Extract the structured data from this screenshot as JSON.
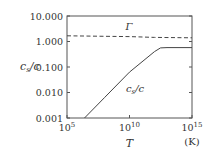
{
  "chart_data": {
    "type": "line",
    "title": "",
    "xlabel": "T",
    "xunit": "(K)",
    "ylabel": "c_s/c",
    "xscale": "log",
    "yscale": "log",
    "xlim": [
      100000.0,
      1000000000000000.0
    ],
    "ylim": [
      0.001,
      10
    ],
    "x_ticks": [
      {
        "value": 100000.0,
        "label": "10",
        "exp": "5"
      },
      {
        "value": 10000000000.0,
        "label": "10",
        "exp": "10"
      },
      {
        "value": 1000000000000000.0,
        "label": "10",
        "exp": "15"
      }
    ],
    "y_ticks": [
      {
        "value": 10,
        "label": "10.000"
      },
      {
        "value": 1,
        "label": "1.000"
      },
      {
        "value": 0.1,
        "label": "0.100"
      },
      {
        "value": 0.01,
        "label": "0.010"
      },
      {
        "value": 0.001,
        "label": "0.001"
      }
    ],
    "grid": false,
    "series": [
      {
        "name": "Γ",
        "style": "dashed",
        "x": [
          100000.0,
          100000000.0,
          10000000000.0,
          1000000000000.0,
          1000000000000000.0
        ],
        "values": [
          1.667,
          1.6,
          1.55,
          1.45,
          1.4
        ]
      },
      {
        "name": "c_s/c",
        "style": "solid",
        "x": [
          2500000.0,
          100000000.0,
          10000000000.0,
          1000000000000.0,
          3000000000000.0,
          10000000000000.0,
          1000000000000000.0
        ],
        "values": [
          0.001,
          0.0063,
          0.063,
          0.4,
          0.56,
          0.577,
          0.577
        ]
      }
    ],
    "annotations": [
      {
        "text": "Γ",
        "near_series": "Γ"
      },
      {
        "text": "c_s/c",
        "near_series": "c_s/c"
      }
    ]
  },
  "labels": {
    "ylabel_main": "c",
    "ylabel_sub": "s",
    "ylabel_rest": "/c",
    "xlabel": "T",
    "xunit": "(K)",
    "gamma": "Γ",
    "cs_main": "c",
    "cs_sub": "s",
    "cs_rest": "/c"
  }
}
